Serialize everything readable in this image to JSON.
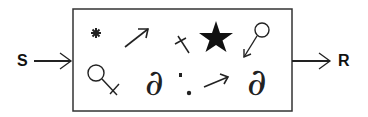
{
  "diagram": {
    "input_label": "S",
    "output_label": "R",
    "box": {
      "description": "process box containing scattered symbols"
    },
    "symbols": [
      {
        "name": "asterisk",
        "glyph": "*"
      },
      {
        "name": "northeast-arrow",
        "glyph": "↗"
      },
      {
        "name": "dagger-cross",
        "glyph": "†"
      },
      {
        "name": "filled-star",
        "glyph": "★"
      },
      {
        "name": "circle-stem-arrow",
        "glyph": "⚲"
      },
      {
        "name": "female-like-circle-cross",
        "glyph": "♀"
      },
      {
        "name": "partial-derivative-left",
        "glyph": "∂"
      },
      {
        "name": "dots",
        "glyph": ":"
      },
      {
        "name": "east-arrow",
        "glyph": "→"
      },
      {
        "name": "partial-derivative-right",
        "glyph": "∂"
      }
    ],
    "colors": {
      "stroke": "#222222",
      "background": "#ffffff"
    }
  }
}
